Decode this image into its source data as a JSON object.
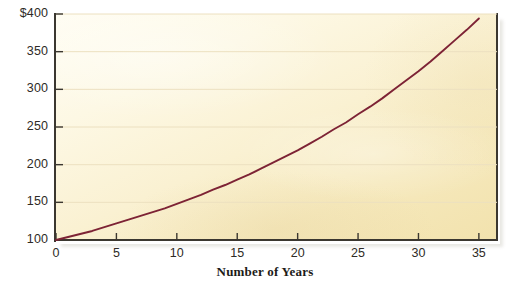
{
  "chart_data": {
    "type": "line",
    "title": "",
    "xlabel": "Number of Years",
    "ylabel": "",
    "xlim": [
      0,
      36.5
    ],
    "ylim": [
      100,
      400
    ],
    "grid": true,
    "legend": false,
    "x_ticks": [
      "0",
      "5",
      "10",
      "15",
      "20",
      "25",
      "30",
      "35"
    ],
    "x_tick_values": [
      0,
      5,
      10,
      15,
      20,
      25,
      30,
      35
    ],
    "y_ticks": [
      "100",
      "150",
      "200",
      "250",
      "300",
      "350",
      "$400"
    ],
    "y_tick_values": [
      100,
      150,
      200,
      250,
      300,
      350,
      400
    ],
    "series": [
      {
        "name": "Compound growth",
        "color": "#7d2335",
        "x": [
          0,
          1,
          2,
          3,
          4,
          5,
          6,
          7,
          8,
          9,
          10,
          11,
          12,
          13,
          14,
          15,
          16,
          17,
          18,
          19,
          20,
          21,
          22,
          23,
          24,
          25,
          26,
          27,
          28,
          29,
          30,
          31,
          32,
          33,
          34,
          35
        ],
        "values": [
          100,
          104,
          108,
          112,
          117,
          122,
          127,
          132,
          137,
          142,
          148,
          154,
          160,
          167,
          173,
          180,
          187,
          195,
          203,
          211,
          219,
          228,
          237,
          247,
          256,
          267,
          277,
          288,
          300,
          312,
          324,
          337,
          351,
          365,
          379,
          394
        ]
      }
    ]
  },
  "axis": {
    "x_label": "Number of Years",
    "y_tick_labels": [
      "$400",
      "350",
      "300",
      "250",
      "200",
      "150",
      "100"
    ],
    "x_tick_labels": [
      "0",
      "5",
      "10",
      "15",
      "20",
      "25",
      "30",
      "35"
    ]
  },
  "colors": {
    "curve": "#7d2335",
    "axis": "#3b3730",
    "gridline": "#ece0c0",
    "plot_background_light": "#fffdf2",
    "plot_background_dark": "#f2e2ad",
    "text": "#2e2b26",
    "page_background": "#ffffff"
  }
}
